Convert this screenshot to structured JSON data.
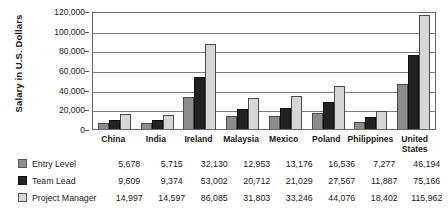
{
  "chart_data": {
    "type": "bar",
    "title": "",
    "xlabel": "",
    "ylabel": "Salary in U.S. Dollars",
    "ylim": [
      0,
      120000
    ],
    "ytick_labels": [
      "120,000",
      "100,000",
      "80,000",
      "60,000",
      "40,000",
      "20,000",
      "0"
    ],
    "ytick_values": [
      120000,
      100000,
      80000,
      60000,
      40000,
      20000,
      0
    ],
    "grid": true,
    "legend_position": "bottom-table",
    "categories": [
      "China",
      "India",
      "Ireland",
      "Malaysia",
      "Mexico",
      "Poland",
      "Philippines",
      "United\nStates"
    ],
    "series": [
      {
        "name": "Entry Level",
        "color": "#8c8c8c",
        "values": [
          5678,
          5715,
          32130,
          12953,
          13176,
          16536,
          7277,
          46194
        ],
        "labels": [
          "5,678",
          "5,715",
          "32,130",
          "12,953",
          "13,176",
          "16,536",
          "7,277",
          "46,194"
        ]
      },
      {
        "name": "Team Lead",
        "color": "#222222",
        "values": [
          9609,
          9374,
          53002,
          20712,
          21029,
          27567,
          11887,
          75166
        ],
        "labels": [
          "9,609",
          "9,374",
          "53,002",
          "20,712",
          "21,029",
          "27,567",
          "11,887",
          "75,166"
        ]
      },
      {
        "name": "Project Manager",
        "color": "#d6d6d6",
        "values": [
          14997,
          14597,
          86085,
          31803,
          33246,
          44076,
          18402,
          115962
        ],
        "labels": [
          "14,997",
          "14,597",
          "86,085",
          "31,803",
          "33,246",
          "44,076",
          "18,402",
          "115,962"
        ]
      }
    ]
  }
}
